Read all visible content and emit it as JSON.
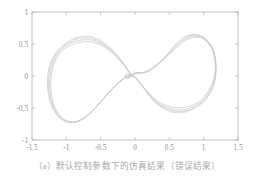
{
  "figure": {
    "caption": "（a）默认控制参数下的仿真结果（错误结果）",
    "caption_color": "#a8a8a8",
    "background_color": "#ffffff"
  },
  "chart_data": {
    "type": "line",
    "title": "",
    "subtitle": "",
    "xlabel": "",
    "ylabel": "",
    "xlim": [
      -1.5,
      1.5
    ],
    "ylim": [
      -1,
      1
    ],
    "xticks": [
      -1.5,
      -1,
      -0.5,
      0,
      0.5,
      1,
      1.5
    ],
    "yticks": [
      -1,
      -0.5,
      0,
      0.5,
      1
    ],
    "xtick_labels": [
      "-1.5",
      "-1",
      "-0.5",
      "0",
      "0.5",
      "1",
      "1.5"
    ],
    "ytick_labels": [
      "-1",
      "-0.5",
      "0",
      "0.5",
      "1"
    ],
    "grid": false,
    "legend": null,
    "legend_position": "none",
    "frame_color": "#b4b4b4",
    "line_color": "#c9c9c9",
    "series": [
      {
        "name": "trace-1",
        "color": "#c9c9c9",
        "points": [
          [
            -0.055,
            0.012
          ],
          [
            -0.02,
            0.04
          ],
          [
            0.03,
            0.055
          ],
          [
            0.1,
            0.05
          ],
          [
            0.22,
            0.1
          ],
          [
            0.36,
            0.22
          ],
          [
            0.5,
            0.38
          ],
          [
            0.62,
            0.53
          ],
          [
            0.74,
            0.62
          ],
          [
            0.88,
            0.645
          ],
          [
            1.0,
            0.59
          ],
          [
            1.1,
            0.46
          ],
          [
            1.16,
            0.28
          ],
          [
            1.175,
            0.07
          ],
          [
            1.15,
            -0.13
          ],
          [
            1.07,
            -0.31
          ],
          [
            0.96,
            -0.44
          ],
          [
            0.82,
            -0.53
          ],
          [
            0.66,
            -0.575
          ],
          [
            0.5,
            -0.55
          ],
          [
            0.36,
            -0.47
          ],
          [
            0.24,
            -0.35
          ],
          [
            0.14,
            -0.21
          ],
          [
            0.06,
            -0.09
          ],
          [
            0.0,
            -0.02
          ],
          [
            -0.05,
            0.005
          ],
          [
            -0.1,
            0.0
          ],
          [
            -0.18,
            -0.06
          ],
          [
            -0.3,
            -0.17
          ],
          [
            -0.44,
            -0.33
          ],
          [
            -0.58,
            -0.5
          ],
          [
            -0.72,
            -0.64
          ],
          [
            -0.86,
            -0.715
          ],
          [
            -1.0,
            -0.71
          ],
          [
            -1.12,
            -0.63
          ],
          [
            -1.21,
            -0.48
          ],
          [
            -1.26,
            -0.3
          ],
          [
            -1.275,
            -0.1
          ],
          [
            -1.26,
            0.1
          ],
          [
            -1.2,
            0.28
          ],
          [
            -1.1,
            0.43
          ],
          [
            -0.97,
            0.54
          ],
          [
            -0.83,
            0.605
          ],
          [
            -0.69,
            0.62
          ],
          [
            -0.56,
            0.585
          ],
          [
            -0.44,
            0.51
          ],
          [
            -0.32,
            0.4
          ],
          [
            -0.21,
            0.26
          ],
          [
            -0.13,
            0.13
          ],
          [
            -0.08,
            0.05
          ],
          [
            -0.055,
            0.012
          ]
        ]
      },
      {
        "name": "trace-2",
        "color": "#c9c9c9",
        "points": [
          [
            -0.055,
            0.01
          ],
          [
            -0.01,
            0.045
          ],
          [
            0.05,
            0.055
          ],
          [
            0.13,
            0.055
          ],
          [
            0.25,
            0.12
          ],
          [
            0.39,
            0.24
          ],
          [
            0.53,
            0.4
          ],
          [
            0.66,
            0.54
          ],
          [
            0.79,
            0.625
          ],
          [
            0.92,
            0.64
          ],
          [
            1.04,
            0.57
          ],
          [
            1.13,
            0.43
          ],
          [
            1.175,
            0.25
          ],
          [
            1.18,
            0.05
          ],
          [
            1.14,
            -0.15
          ],
          [
            1.05,
            -0.33
          ],
          [
            0.93,
            -0.45
          ],
          [
            0.79,
            -0.53
          ],
          [
            0.63,
            -0.555
          ],
          [
            0.48,
            -0.52
          ],
          [
            0.34,
            -0.44
          ],
          [
            0.22,
            -0.32
          ],
          [
            0.13,
            -0.19
          ],
          [
            0.05,
            -0.08
          ],
          [
            -0.01,
            -0.015
          ],
          [
            -0.055,
            0.005
          ],
          [
            -0.11,
            -0.005
          ],
          [
            -0.2,
            -0.07
          ],
          [
            -0.32,
            -0.19
          ],
          [
            -0.46,
            -0.36
          ],
          [
            -0.6,
            -0.52
          ],
          [
            -0.74,
            -0.655
          ],
          [
            -0.88,
            -0.72
          ],
          [
            -1.01,
            -0.705
          ],
          [
            -1.12,
            -0.62
          ],
          [
            -1.205,
            -0.47
          ],
          [
            -1.25,
            -0.29
          ],
          [
            -1.26,
            -0.09
          ],
          [
            -1.24,
            0.11
          ],
          [
            -1.18,
            0.29
          ],
          [
            -1.08,
            0.43
          ],
          [
            -0.95,
            0.53
          ],
          [
            -0.81,
            0.585
          ],
          [
            -0.67,
            0.595
          ],
          [
            -0.55,
            0.555
          ],
          [
            -0.43,
            0.48
          ],
          [
            -0.31,
            0.37
          ],
          [
            -0.2,
            0.24
          ],
          [
            -0.12,
            0.12
          ],
          [
            -0.075,
            0.045
          ],
          [
            -0.055,
            0.01
          ]
        ]
      },
      {
        "name": "trace-3",
        "color": "#c9c9c9",
        "points": [
          [
            -0.055,
            0.008
          ],
          [
            0.0,
            0.042
          ],
          [
            0.07,
            0.052
          ],
          [
            0.16,
            0.06
          ],
          [
            0.28,
            0.14
          ],
          [
            0.42,
            0.27
          ],
          [
            0.56,
            0.42
          ],
          [
            0.69,
            0.55
          ],
          [
            0.82,
            0.615
          ],
          [
            0.95,
            0.615
          ],
          [
            1.06,
            0.54
          ],
          [
            1.14,
            0.4
          ],
          [
            1.175,
            0.22
          ],
          [
            1.17,
            0.03
          ],
          [
            1.12,
            -0.16
          ],
          [
            1.02,
            -0.335
          ],
          [
            0.9,
            -0.45
          ],
          [
            0.76,
            -0.515
          ],
          [
            0.61,
            -0.53
          ],
          [
            0.46,
            -0.49
          ],
          [
            0.32,
            -0.41
          ],
          [
            0.21,
            -0.29
          ],
          [
            0.12,
            -0.17
          ],
          [
            0.045,
            -0.07
          ],
          [
            -0.015,
            -0.012
          ],
          [
            -0.06,
            0.004
          ],
          [
            -0.12,
            -0.012
          ],
          [
            -0.22,
            -0.085
          ],
          [
            -0.34,
            -0.21
          ],
          [
            -0.48,
            -0.38
          ],
          [
            -0.62,
            -0.55
          ],
          [
            -0.76,
            -0.675
          ],
          [
            -0.89,
            -0.725
          ],
          [
            -1.02,
            -0.7
          ],
          [
            -1.12,
            -0.605
          ],
          [
            -1.195,
            -0.45
          ],
          [
            -1.235,
            -0.275
          ],
          [
            -1.24,
            -0.08
          ],
          [
            -1.22,
            0.115
          ],
          [
            -1.155,
            0.295
          ],
          [
            -1.06,
            0.43
          ],
          [
            -0.93,
            0.515
          ],
          [
            -0.79,
            0.56
          ],
          [
            -0.65,
            0.565
          ],
          [
            -0.53,
            0.525
          ],
          [
            -0.41,
            0.45
          ],
          [
            -0.3,
            0.345
          ],
          [
            -0.195,
            0.22
          ],
          [
            -0.115,
            0.11
          ],
          [
            -0.075,
            0.04
          ],
          [
            -0.055,
            0.008
          ]
        ]
      },
      {
        "name": "trace-4",
        "color": "#c9c9c9",
        "points": [
          [
            -0.055,
            0.006
          ],
          [
            0.01,
            0.038
          ],
          [
            0.09,
            0.05
          ],
          [
            0.19,
            0.07
          ],
          [
            0.31,
            0.16
          ],
          [
            0.45,
            0.29
          ],
          [
            0.59,
            0.43
          ],
          [
            0.72,
            0.545
          ],
          [
            0.85,
            0.6
          ],
          [
            0.97,
            0.59
          ],
          [
            1.07,
            0.51
          ],
          [
            1.14,
            0.37
          ],
          [
            1.17,
            0.19
          ],
          [
            1.16,
            0.01
          ],
          [
            1.1,
            -0.175
          ],
          [
            1.0,
            -0.34
          ],
          [
            0.87,
            -0.44
          ],
          [
            0.73,
            -0.49
          ],
          [
            0.58,
            -0.495
          ],
          [
            0.44,
            -0.455
          ],
          [
            0.31,
            -0.375
          ],
          [
            0.2,
            -0.265
          ],
          [
            0.11,
            -0.155
          ],
          [
            0.04,
            -0.06
          ],
          [
            -0.02,
            -0.008
          ],
          [
            -0.065,
            0.002
          ],
          [
            -0.13,
            -0.02
          ],
          [
            -0.24,
            -0.1
          ],
          [
            -0.36,
            -0.23
          ],
          [
            -0.5,
            -0.4
          ],
          [
            -0.64,
            -0.565
          ],
          [
            -0.78,
            -0.68
          ],
          [
            -0.9,
            -0.72
          ],
          [
            -1.02,
            -0.685
          ],
          [
            -1.115,
            -0.585
          ],
          [
            -1.185,
            -0.43
          ],
          [
            -1.22,
            -0.26
          ],
          [
            -1.225,
            -0.07
          ],
          [
            -1.2,
            0.12
          ],
          [
            -1.135,
            0.29
          ],
          [
            -1.04,
            0.42
          ],
          [
            -0.91,
            0.49
          ],
          [
            -0.77,
            0.53
          ],
          [
            -0.64,
            0.535
          ],
          [
            -0.52,
            0.495
          ],
          [
            -0.4,
            0.42
          ],
          [
            -0.29,
            0.32
          ],
          [
            -0.19,
            0.205
          ],
          [
            -0.11,
            0.1
          ],
          [
            -0.07,
            0.036
          ],
          [
            -0.055,
            0.006
          ]
        ]
      },
      {
        "name": "center-loop",
        "color": "#c9c9c9",
        "points": [
          [
            -0.055,
            0.01
          ],
          [
            -0.085,
            0.03
          ],
          [
            -0.115,
            0.032
          ],
          [
            -0.14,
            0.018
          ],
          [
            -0.148,
            -0.004
          ],
          [
            -0.138,
            -0.026
          ],
          [
            -0.112,
            -0.038
          ],
          [
            -0.082,
            -0.034
          ],
          [
            -0.06,
            -0.018
          ],
          [
            -0.05,
            0.0
          ],
          [
            -0.055,
            0.01
          ]
        ]
      },
      {
        "name": "center-loop-inner",
        "color": "#c9c9c9",
        "points": [
          [
            -0.06,
            0.008
          ],
          [
            -0.085,
            0.022
          ],
          [
            -0.11,
            0.024
          ],
          [
            -0.128,
            0.012
          ],
          [
            -0.133,
            -0.004
          ],
          [
            -0.124,
            -0.02
          ],
          [
            -0.104,
            -0.028
          ],
          [
            -0.08,
            -0.024
          ],
          [
            -0.063,
            -0.012
          ],
          [
            -0.056,
            0.0
          ],
          [
            -0.06,
            0.008
          ]
        ]
      }
    ]
  }
}
